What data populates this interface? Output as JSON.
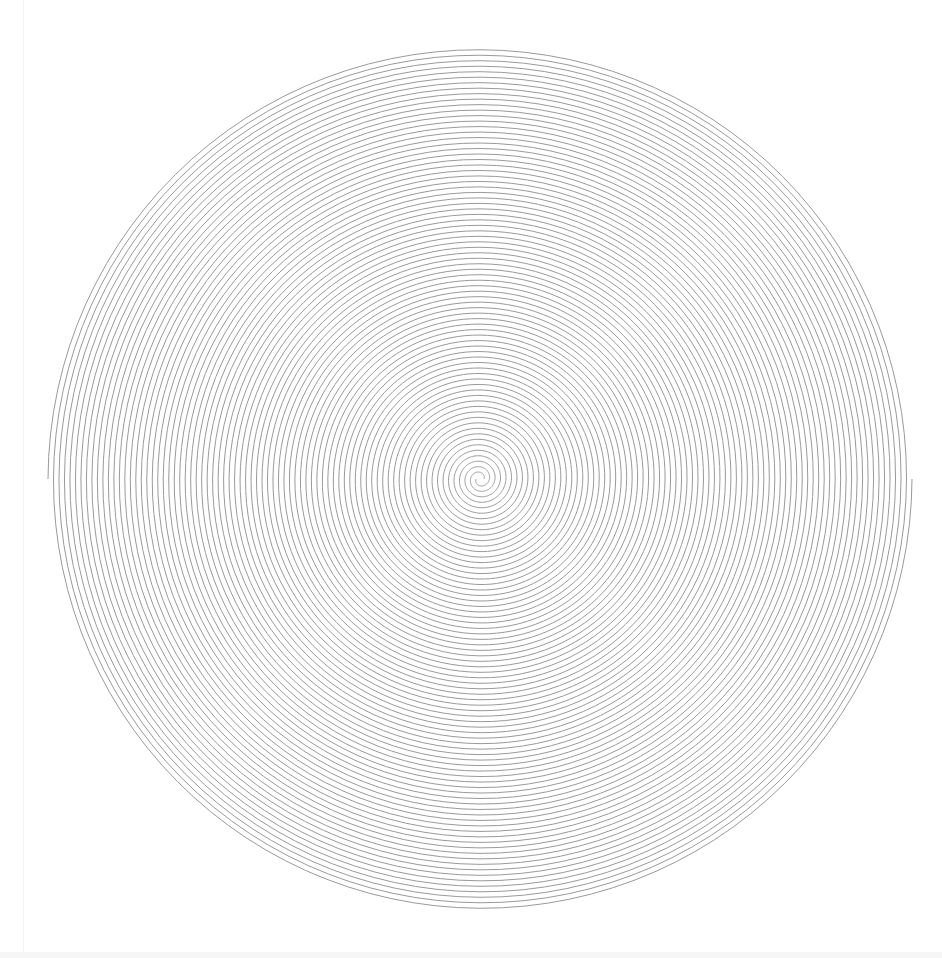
{
  "artwork": {
    "type": "double-spiral",
    "center": [
      480,
      479
    ],
    "inner_radius": 4,
    "outer_radius": 432,
    "turns": 39,
    "arms": 2,
    "stroke_color": "#9a9a9a",
    "stroke_width": 1,
    "background": "#ffffff",
    "canvas": {
      "width": 942,
      "height": 958
    }
  }
}
